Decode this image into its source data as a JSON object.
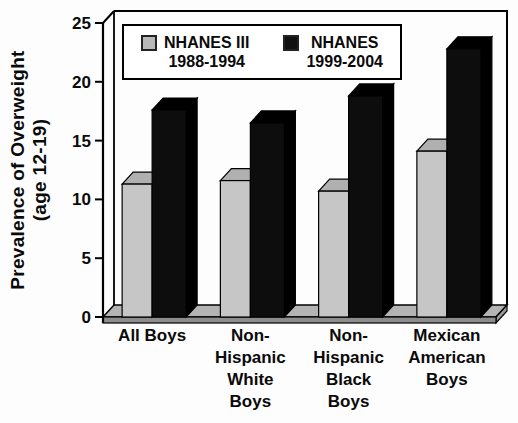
{
  "chart_data": {
    "type": "bar",
    "style": "3d-column",
    "title": "",
    "y_axis": {
      "title_line1": "Prevalence of Overweight",
      "title_line2": "(age 12-19)",
      "ticks": [
        0,
        5,
        10,
        15,
        20,
        25
      ],
      "range": [
        0,
        25
      ]
    },
    "categories": [
      "All Boys",
      "Non-Hispanic White Boys",
      "Non-Hispanic Black Boys",
      "Mexican American Boys"
    ],
    "categories_lines": [
      [
        "All Boys"
      ],
      [
        "Non-",
        "Hispanic",
        "White",
        "Boys"
      ],
      [
        "Non-",
        "Hispanic",
        "Black",
        "Boys"
      ],
      [
        "Mexican",
        "American",
        "Boys"
      ]
    ],
    "series": [
      {
        "name": "NHANES III",
        "sublabel": "1988-1994",
        "values": [
          11.3,
          11.6,
          10.7,
          14.1
        ],
        "color": "#c6c6c6",
        "top_color": "#b0b0b0",
        "side_color": "#9e9e9e",
        "legend_marker_color": "#b8b8b8"
      },
      {
        "name": "NHANES",
        "sublabel": "1999-2004",
        "values": [
          17.6,
          16.5,
          18.8,
          22.8
        ],
        "color": "#0d0d0d",
        "top_color": "#000000",
        "side_color": "#000000",
        "legend_marker_color": "#111111"
      }
    ],
    "legend_position": "top-inside",
    "grid": false
  }
}
